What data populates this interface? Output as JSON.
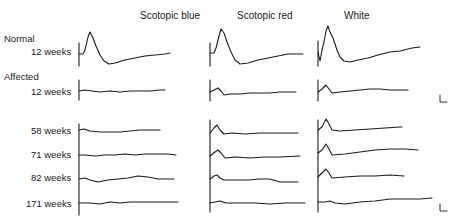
{
  "figure": {
    "columns": [
      {
        "title": "Scotopic blue",
        "x": 140
      },
      {
        "title": "Scotopic red",
        "x": 237
      },
      {
        "title": "White",
        "x": 344
      }
    ],
    "groups": [
      {
        "label": "Normal",
        "y": 34
      },
      {
        "label": "Affected",
        "y": 73
      }
    ],
    "rows": [
      {
        "label": "12 weeks",
        "y": 51,
        "group": "Normal"
      },
      {
        "label": "12 weeks",
        "y": 92,
        "group": "Affected"
      },
      {
        "label": "58 weeks",
        "y": 131
      },
      {
        "label": "71 weeks",
        "y": 155
      },
      {
        "label": "82 weeks",
        "y": 178
      },
      {
        "label": "171 weeks",
        "y": 204
      }
    ],
    "scale_bars": [
      {
        "x": 440,
        "y": 100
      },
      {
        "x": 440,
        "y": 209
      }
    ],
    "trace_color": "#1a1a1a"
  }
}
